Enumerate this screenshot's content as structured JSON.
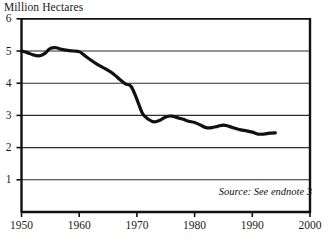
{
  "chart_data": {
    "type": "line",
    "title": "Million Hectares",
    "xlabel": "",
    "ylabel": "Million Hectares",
    "xlim": [
      1950,
      2000
    ],
    "ylim": [
      0,
      6
    ],
    "grid": true,
    "legend": null,
    "xticks": [
      1950,
      1960,
      1970,
      1980,
      1990,
      2000
    ],
    "yticks": [
      1,
      2,
      3,
      4,
      5,
      6
    ],
    "xtick_labels": [
      "1950",
      "1960",
      "1970",
      "1980",
      "1990",
      "2000"
    ],
    "ytick_labels": [
      "1",
      "2",
      "3",
      "4",
      "5",
      "6"
    ],
    "annotations": [
      {
        "name": "source-note",
        "text": "Source: See endnote 3",
        "style": "italic",
        "position": "bottom-right inside plot"
      }
    ],
    "series": [
      {
        "name": "Area",
        "color": "#111111",
        "line_width": 3.2,
        "x": [
          1950,
          1951,
          1952,
          1953,
          1954,
          1955,
          1956,
          1957,
          1958,
          1959,
          1960,
          1961,
          1962,
          1963,
          1964,
          1965,
          1966,
          1967,
          1968,
          1969,
          1970,
          1971,
          1972,
          1973,
          1974,
          1975,
          1976,
          1977,
          1978,
          1979,
          1980,
          1981,
          1982,
          1983,
          1984,
          1985,
          1986,
          1987,
          1988,
          1989,
          1990,
          1991,
          1992,
          1993,
          1994
        ],
        "values": [
          5.0,
          4.95,
          4.88,
          4.85,
          4.92,
          5.08,
          5.1,
          5.05,
          5.02,
          5.0,
          4.98,
          4.85,
          4.72,
          4.6,
          4.5,
          4.4,
          4.28,
          4.12,
          3.98,
          3.9,
          3.5,
          3.05,
          2.88,
          2.8,
          2.85,
          2.95,
          2.98,
          2.93,
          2.88,
          2.82,
          2.78,
          2.7,
          2.62,
          2.62,
          2.66,
          2.7,
          2.66,
          2.6,
          2.55,
          2.52,
          2.48,
          2.42,
          2.42,
          2.45,
          2.46
        ]
      }
    ]
  },
  "figure": {
    "title": "Million Hectares",
    "source_note": "Source: See endnote 3"
  }
}
